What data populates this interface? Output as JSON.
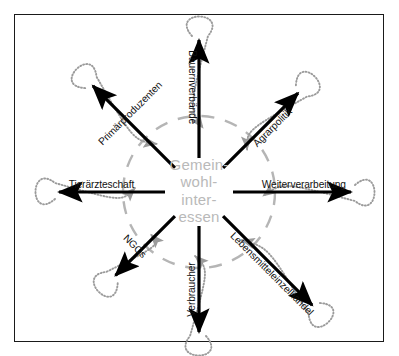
{
  "diagram": {
    "title_center": {
      "lines": [
        "Gemein-",
        "wohl-",
        "inter-",
        "essen"
      ],
      "color": "#b9b9b9"
    },
    "colors": {
      "arrow": "#000000",
      "return_loop": "#9b9b9b",
      "dashed_circle": "#b5b5b5",
      "frame": "#1a1a1a",
      "background": "#ffffff"
    },
    "geometry": {
      "center_x": 199,
      "center_y": 192,
      "dashed_circle_radius": 76
    },
    "spokes": [
      {
        "id": "bauernverbaende",
        "label": "Bauernverbände",
        "angle_deg": 270,
        "text_rotation": 90,
        "length": 152
      },
      {
        "id": "agrarpolitik",
        "label": "Agrarpolitik",
        "angle_deg": 315,
        "text_rotation": -45,
        "length": 140
      },
      {
        "id": "weiterverarbeitung",
        "label": "Weiterverarbeitung",
        "angle_deg": 0,
        "text_rotation": 0,
        "length": 152
      },
      {
        "id": "lebensmitteleinzelhandel",
        "label": "Lebensmitteleinzelhandel",
        "angle_deg": 45,
        "text_rotation": 45,
        "length": 160
      },
      {
        "id": "verbraucher",
        "label": "Verbraucher",
        "angle_deg": 90,
        "text_rotation": -90,
        "length": 140
      },
      {
        "id": "ngos",
        "label": "NGOs",
        "angle_deg": 135,
        "text_rotation": 45,
        "length": 118
      },
      {
        "id": "tieraerzteschaft",
        "label": "Tierärzteschaft",
        "angle_deg": 180,
        "text_rotation": 0,
        "length": 140
      },
      {
        "id": "primaerproduzenten",
        "label": "Primärproduzenten",
        "angle_deg": 225,
        "text_rotation": -45,
        "length": 150
      }
    ]
  }
}
